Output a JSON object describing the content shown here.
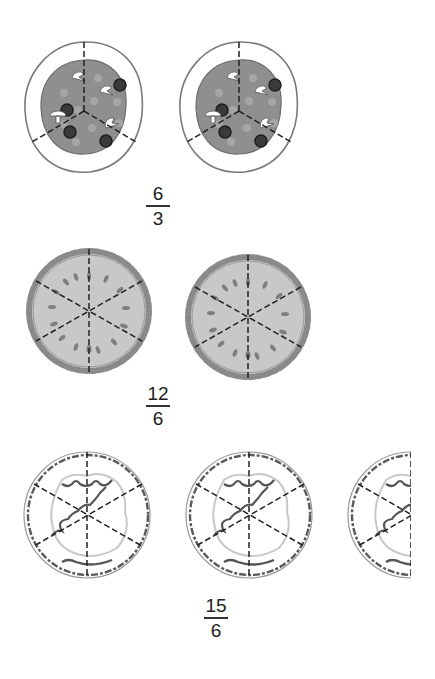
{
  "rows": [
    {
      "food": "pizza",
      "slices_per_item": 3,
      "items_shown": 2,
      "fraction": {
        "numerator": "6",
        "denominator": "3"
      }
    },
    {
      "food": "pie",
      "slices_per_item": 6,
      "items_shown": 2,
      "fraction": {
        "numerator": "12",
        "denominator": "6"
      }
    },
    {
      "food": "quiche",
      "slices_per_item": 6,
      "items_shown": 2.5,
      "fraction": {
        "numerator": "15",
        "denominator": "6"
      }
    }
  ],
  "colors": {
    "crust": "#ffffff",
    "sauce": "#8f8f8f",
    "pepperoni": "#3a3a3a",
    "pie_fill": "#c4c4c4",
    "outline": "#777777",
    "cut_line": "#222222"
  }
}
